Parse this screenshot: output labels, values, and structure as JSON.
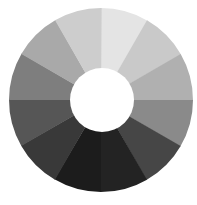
{
  "diagram": {
    "type": "grayscale-value-wheel",
    "center": [
      101,
      100
    ],
    "outer_radius": 92,
    "inner_radius": 32,
    "segment_count": 12,
    "start_angle_deg": 0,
    "direction": "clockwise-from-top",
    "background": "#ffffff",
    "hole_color": "#ffffff",
    "segments": [
      {
        "index": 0,
        "color": "#e4e4e4"
      },
      {
        "index": 1,
        "color": "#c9c9c9"
      },
      {
        "index": 2,
        "color": "#b0b0b0"
      },
      {
        "index": 3,
        "color": "#8a8a8a"
      },
      {
        "index": 4,
        "color": "#464646"
      },
      {
        "index": 5,
        "color": "#232323"
      },
      {
        "index": 6,
        "color": "#1c1c1c"
      },
      {
        "index": 7,
        "color": "#393939"
      },
      {
        "index": 8,
        "color": "#565656"
      },
      {
        "index": 9,
        "color": "#7e7e7e"
      },
      {
        "index": 10,
        "color": "#a9a9a9"
      },
      {
        "index": 11,
        "color": "#cdcdcd"
      }
    ]
  }
}
